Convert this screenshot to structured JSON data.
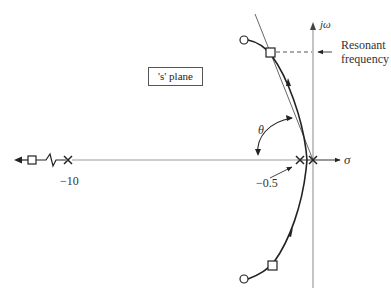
{
  "diagram": {
    "type": "root-locus",
    "plane_label": "'s' plane",
    "axes": {
      "imag_label": "jω",
      "real_label": "σ"
    },
    "annotations": {
      "resonant": [
        "Resonant",
        "frequency"
      ],
      "angle": "θ",
      "pole_far": "−10",
      "pole_near": "−0.5"
    },
    "poles": [
      {
        "label": "−10",
        "marker": "x"
      },
      {
        "label": "−0.5",
        "marker": "x"
      },
      {
        "label": "0",
        "marker": "x"
      }
    ],
    "markers": {
      "closed_loop_squares": 3,
      "zeros_circles": 2
    }
  }
}
